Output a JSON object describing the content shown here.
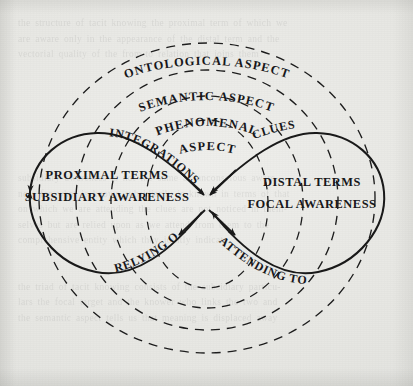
{
  "figure": {
    "kind": "tacit-knowing-lemniscate-diagram",
    "background_color": "#e9e9e6",
    "ink_color": "#191919",
    "ghost_text": "the structure of tacit knowing the proximal term of which we\nare aware only in the appearance of the distal term and the\nvectorial quality of the from-to relation that joins them\n\n\n\n\n\n\n\nsubsidiary awareness is not the same as unconscious aware-\nness for what is known subsidiarily is known in terms of that\non which we are attending the clues are not noticed in them-\nselves but are relied upon as we attend from them to the\ncomprehensive entity which they jointly indicate\n\n\nthe triad of tacit knowing consists of the subsidiary particu-\nlars the focal target and the knower who links the two and\nthe semantic aspect tells us that meaning is displaced away"
  },
  "aspects": {
    "outer": "ONTOLOGICAL ASPECT",
    "middle": "SEMANTIC ASPECT",
    "inner_line1": "PHENOMENAL",
    "inner_line2": "ASPECT"
  },
  "terms": {
    "left_line1": "PROXIMAL TERMS",
    "left_line2": "SUBSIDIARY AWARENESS",
    "right_line1": "DISTAL TERMS",
    "right_line2": "FOCAL AWARENESS"
  },
  "flows": {
    "upper_left": "INTEGRATIONS",
    "upper_right": "CLUES",
    "lower_left": "RELYING ON",
    "lower_right": "ATTENDING TO"
  }
}
